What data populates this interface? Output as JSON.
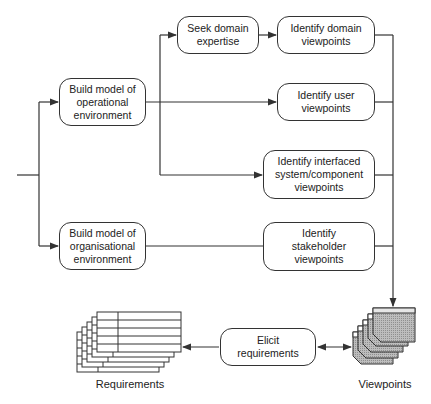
{
  "diagram": {
    "type": "process-flow",
    "nodes": {
      "seek_domain": "Seek domain\nexpertise",
      "identify_domain": "Identify domain\nviewpoints",
      "build_operational": "Build model of\noperational\nenvironment",
      "identify_user": "Identify user\nviewpoints",
      "identify_interfaced": "Identify interfaced\nsystem/component\nviewpoints",
      "build_organisational": "Build model of\norganisational\nenvironment",
      "identify_stakeholder": "Identify\nstakeholder\nviewpoints",
      "elicit": "Elicit\nrequirements"
    },
    "labels": {
      "requirements": "Requirements",
      "viewpoints": "Viewpoints"
    },
    "colors": {
      "stroke": "#333333",
      "viewpoint_fill": "#bdbdbd",
      "viewpoint_header": "#d9d9d9"
    }
  }
}
